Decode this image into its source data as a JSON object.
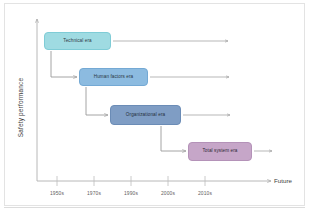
{
  "figure": {
    "type": "diagram",
    "kind": "safety-era-timeline",
    "axes": {
      "y_label": "Safety performance",
      "x_future_label": "Future",
      "x_ticks": [
        {
          "label": "1950s",
          "x": 57
        },
        {
          "label": "1970s",
          "x": 94
        },
        {
          "label": "1990s",
          "x": 131
        },
        {
          "label": "2000s",
          "x": 168
        },
        {
          "label": "2010s",
          "x": 205
        }
      ]
    },
    "eras": [
      {
        "id": "technical",
        "label": "Technical era",
        "color": "#9fdbe2",
        "border_color": "#7fccd6",
        "row": 1,
        "start_tick": "1950s",
        "continues_to": "present"
      },
      {
        "id": "human-factors",
        "label": "Human factors era",
        "color": "#8cbbe0",
        "border_color": "#74a9d4",
        "row": 2,
        "start_tick": "1970s",
        "continues_to": "present"
      },
      {
        "id": "organizational",
        "label": "Organizational era",
        "color": "#7f9dc4",
        "border_color": "#6b8cb6",
        "row": 3,
        "start_tick": "1990s",
        "continues_to": "present"
      },
      {
        "id": "total-system",
        "label": "Total system era",
        "color": "#c6a6c8",
        "border_color": "#b492b8",
        "row": 4,
        "start_tick": "2000s",
        "continues_to": "future"
      }
    ],
    "palette": {
      "axis": "#b0b0b0",
      "connector": "#9a9a9a",
      "frame": "#e3e3e3",
      "text": "#3c3c3c"
    }
  }
}
